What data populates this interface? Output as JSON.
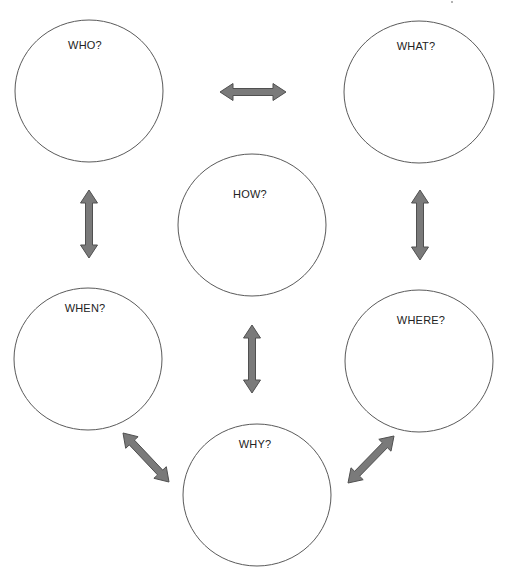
{
  "diagram": {
    "title": "",
    "colors": {
      "circle_stroke": "#5a5a5a",
      "arrow_fill": "#7a7a7a",
      "arrow_stroke": "#505050",
      "text": "#222222",
      "background": "#ffffff"
    },
    "nodes": [
      {
        "id": "who",
        "label": "WHO?",
        "cx": 89,
        "cy": 91,
        "rx": 74,
        "ry": 71,
        "label_x": 85,
        "label_y": 39
      },
      {
        "id": "what",
        "label": "WHAT?",
        "cx": 419,
        "cy": 92,
        "rx": 75,
        "ry": 71,
        "label_x": 416,
        "label_y": 40
      },
      {
        "id": "how",
        "label": "HOW?",
        "cx": 252,
        "cy": 225,
        "rx": 74,
        "ry": 71,
        "label_x": 250,
        "label_y": 188
      },
      {
        "id": "when",
        "label": "WHEN?",
        "cx": 88,
        "cy": 359,
        "rx": 74,
        "ry": 71,
        "label_x": 85,
        "label_y": 302
      },
      {
        "id": "where",
        "label": "WHERE?",
        "cx": 419,
        "cy": 361,
        "rx": 74,
        "ry": 71,
        "label_x": 421,
        "label_y": 314
      },
      {
        "id": "why",
        "label": "WHY?",
        "cx": 257,
        "cy": 495,
        "rx": 74,
        "ry": 71,
        "label_x": 255,
        "label_y": 438
      }
    ],
    "connectors": [
      {
        "id": "who-what",
        "from": "who",
        "to": "what",
        "type": "double-arrow",
        "x1": 220,
        "y1": 92,
        "x2": 286,
        "y2": 92
      },
      {
        "id": "who-when",
        "from": "who",
        "to": "when",
        "type": "double-arrow",
        "x1": 89,
        "y1": 190,
        "x2": 89,
        "y2": 258
      },
      {
        "id": "what-where",
        "from": "what",
        "to": "where",
        "type": "double-arrow",
        "x1": 420,
        "y1": 190,
        "x2": 420,
        "y2": 260
      },
      {
        "id": "how-why",
        "from": "how",
        "to": "why",
        "type": "double-arrow",
        "x1": 252,
        "y1": 325,
        "x2": 252,
        "y2": 393
      },
      {
        "id": "when-why",
        "from": "when",
        "to": "why",
        "type": "double-arrow",
        "x1": 123,
        "y1": 433,
        "x2": 169,
        "y2": 482
      },
      {
        "id": "where-why",
        "from": "where",
        "to": "why",
        "type": "double-arrow",
        "x1": 394,
        "y1": 436,
        "x2": 348,
        "y2": 483
      }
    ]
  }
}
